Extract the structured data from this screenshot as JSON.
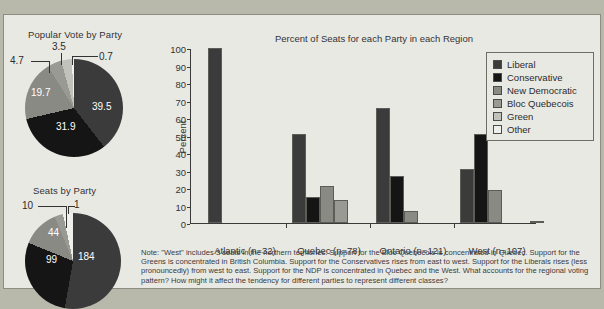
{
  "figure": {
    "background_color": "#e9e9e4",
    "page_background_color": "#b9b9ab"
  },
  "palette": {
    "liberal": "#3b3b3b",
    "conservative": "#151515",
    "new_democratic": "#8a8a85",
    "bloc_quebecois": "#9a9a94",
    "green": "#c2c2bc",
    "other": "#efefeb"
  },
  "legend": {
    "position": "top-right",
    "items": [
      {
        "label": "Liberal",
        "color": "#3b3b3b",
        "swatch": "liberal-swatch"
      },
      {
        "label": "Conservative",
        "color": "#151515",
        "swatch": "conservative-swatch"
      },
      {
        "label": "New Democratic",
        "color": "#8a8a85",
        "swatch": "new-democratic-swatch"
      },
      {
        "label": "Bloc Quebecois",
        "color": "#9a9a94",
        "swatch": "bloc-quebecois-swatch"
      },
      {
        "label": "Green",
        "color": "#c2c2bc",
        "swatch": "green-swatch"
      },
      {
        "label": "Other",
        "color": "#efefeb",
        "swatch": "other-swatch"
      }
    ]
  },
  "note": {
    "text": "Note: \"West\" includes 3 seats in the northern territories. Support for the Bloc Quebecois is concentrated in Quebec. Support for the Greens is concentrated in British Columbia. Support for the Conservatives rises from east to west. Support for the Liberals rises (less pronouncedly) from west to east. Support for the NDP is concentrated in Quebec and the West. What accounts for the regional voting pattern? How might it affect the tendency for different parties to represent different classes?"
  },
  "chart_data": [
    {
      "type": "pie",
      "name": "popular-vote-pie",
      "title": "Popular Vote by Party",
      "unit": "percent",
      "labels": [
        "Liberal",
        "Conservative",
        "New Democratic",
        "Bloc Quebecois",
        "Green",
        "Other"
      ],
      "values": [
        39.5,
        31.9,
        19.7,
        4.7,
        3.5,
        0.7
      ],
      "value_labels": [
        "39.5",
        "31.9",
        "19.7",
        "4.7",
        "3.5",
        "0.7"
      ],
      "colors": [
        "#3b3b3b",
        "#151515",
        "#8a8a85",
        "#9a9a94",
        "#c2c2bc",
        "#efefeb"
      ],
      "label_placement": [
        "inside",
        "inside",
        "inside",
        "outside",
        "outside",
        "outside"
      ]
    },
    {
      "type": "pie",
      "name": "seats-pie",
      "title": "Seats by Party",
      "unit": "seats",
      "labels": [
        "Liberal",
        "Conservative",
        "New Democratic",
        "Bloc Quebecois",
        "Green",
        "Other"
      ],
      "values": [
        184,
        99,
        44,
        10,
        0,
        1
      ],
      "value_labels": [
        "184",
        "99",
        "44",
        "10",
        "",
        "1"
      ],
      "colors": [
        "#3b3b3b",
        "#151515",
        "#8a8a85",
        "#9a9a94",
        "#c2c2bc",
        "#efefeb"
      ],
      "label_placement": [
        "inside",
        "inside",
        "inside",
        "outside",
        "none",
        "outside"
      ]
    },
    {
      "type": "bar",
      "name": "seats-by-region-bar",
      "title": "Percent of Seats for each Party in each Region",
      "xlabel": "",
      "ylabel": "Percent",
      "ylim": [
        0,
        100
      ],
      "yticks": [
        0,
        10,
        20,
        30,
        40,
        50,
        60,
        70,
        80,
        90,
        100
      ],
      "grid": false,
      "categories": [
        "Atlantic (n=32)",
        "Quebec (n=78)",
        "Ontario (n=121)",
        "West (n=107)"
      ],
      "series": [
        {
          "name": "Liberal",
          "color": "#3b3b3b",
          "values": [
            100,
            51,
            66,
            31
          ]
        },
        {
          "name": "Conservative",
          "color": "#151515",
          "values": [
            0,
            15,
            27,
            51
          ]
        },
        {
          "name": "New Democratic",
          "color": "#8a8a85",
          "values": [
            0,
            21,
            7,
            19
          ]
        },
        {
          "name": "Bloc Quebecois",
          "color": "#9a9a94",
          "values": [
            0,
            13,
            0,
            0
          ]
        },
        {
          "name": "Green",
          "color": "#c2c2bc",
          "values": [
            0,
            0,
            0,
            0
          ]
        },
        {
          "name": "Other",
          "color": "#efefeb",
          "values": [
            0,
            0,
            0,
            1
          ]
        }
      ]
    }
  ]
}
